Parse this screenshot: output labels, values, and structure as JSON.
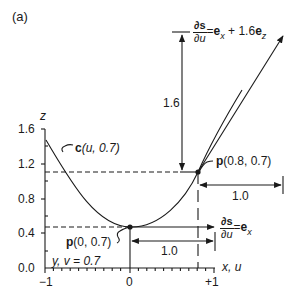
{
  "panel_label": "(a)",
  "axes": {
    "z_label": "z",
    "x_label": "x, u",
    "y_ticks": [
      "1.6",
      "1.2",
      "0.8",
      "0.4",
      "0.0"
    ],
    "x_ticks": [
      "−1",
      "0",
      "+1"
    ],
    "slice_label": "y, v = 0.7"
  },
  "curve_label": {
    "bold": "c",
    "rest": "(u, 0.7)"
  },
  "points": [
    {
      "bold": "p",
      "rest": "(0, 0.7)"
    },
    {
      "bold": "p",
      "rest": "(0.8, 0.7)"
    }
  ],
  "dimensions": {
    "vertical_rise": "1.6",
    "run_top": "1.0",
    "run_bottom": "1.0"
  },
  "derivatives": {
    "top": {
      "num": "∂s",
      "den": "∂u",
      "eq": "=",
      "rhs_a": "e",
      "rhs_a_sub": "x",
      "rhs_mid": " + 1.6",
      "rhs_b": "e",
      "rhs_b_sub": "z"
    },
    "bottom": {
      "num": "∂s",
      "den": "∂u",
      "eq": "=",
      "rhs_a": "e",
      "rhs_a_sub": "x"
    }
  },
  "colors": {
    "ink": "#1a1a1a",
    "background": "#ffffff"
  }
}
